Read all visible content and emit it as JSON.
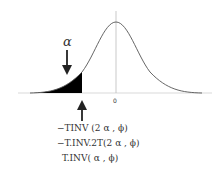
{
  "diagram": {
    "type": "t-distribution-left-tail",
    "alpha_label": "α",
    "zero_label": "0",
    "formulas": [
      "−TINV (2 α , ϕ)",
      "−T.INV.2T(2 α , ϕ)",
      "T.INV( α , ϕ)"
    ],
    "colors": {
      "curve": "#555555",
      "shade": "#000000",
      "axis": "#bbbbbb"
    }
  }
}
